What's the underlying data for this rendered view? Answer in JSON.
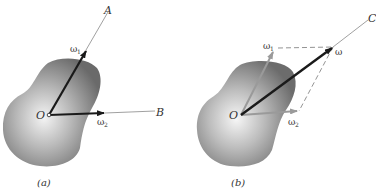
{
  "figure": {
    "panels": [
      {
        "id": "a",
        "caption": "(a)",
        "origin_label": "O",
        "axes": [
          {
            "label": "A",
            "vector_label": "ω",
            "vector_sub": "1"
          },
          {
            "label": "B",
            "vector_label": "ω",
            "vector_sub": "2"
          }
        ]
      },
      {
        "id": "b",
        "caption": "(b)",
        "origin_label": "O",
        "resultant_axis_label": "C",
        "resultant_label": "ω",
        "components": [
          {
            "vector_label": "ω",
            "vector_sub": "1"
          },
          {
            "vector_label": "ω",
            "vector_sub": "2"
          }
        ]
      }
    ],
    "colors": {
      "vector_dark": "#1a1a1a",
      "vector_gray": "#9a9a9a",
      "axis_line": "#888888",
      "blob_light": "#e8e8e8",
      "blob_dark": "#6e6e6e"
    }
  }
}
